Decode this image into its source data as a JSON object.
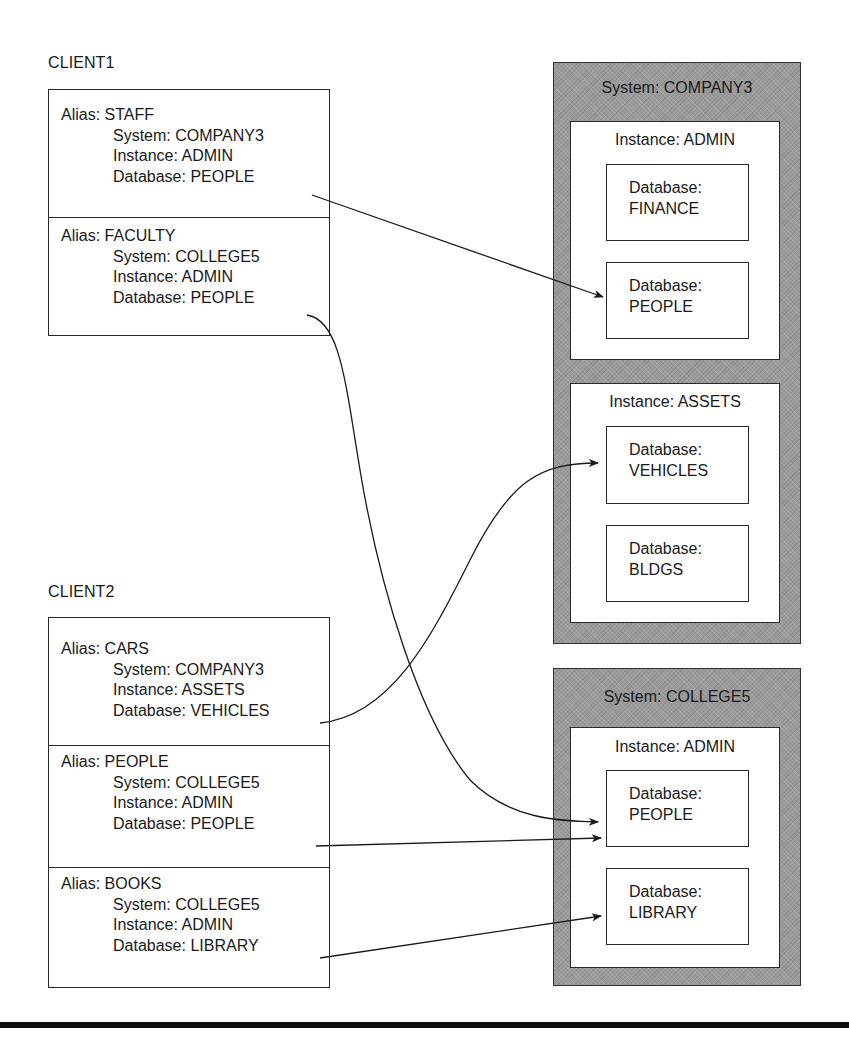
{
  "clients": [
    {
      "label": "CLIENT1",
      "aliases": [
        {
          "alias": "Alias: STAFF",
          "system": "System: COMPANY3",
          "instance": "Instance: ADMIN",
          "database": "Database: PEOPLE"
        },
        {
          "alias": "Alias: FACULTY",
          "system": "System: COLLEGE5",
          "instance": "Instance: ADMIN",
          "database": "Database: PEOPLE"
        }
      ]
    },
    {
      "label": "CLIENT2",
      "aliases": [
        {
          "alias": "Alias: CARS",
          "system": "System: COMPANY3",
          "instance": "Instance: ASSETS",
          "database": "Database: VEHICLES"
        },
        {
          "alias": "Alias: PEOPLE",
          "system": "System: COLLEGE5",
          "instance": "Instance: ADMIN",
          "database": "Database: PEOPLE"
        },
        {
          "alias": "Alias: BOOKS",
          "system": "System: COLLEGE5",
          "instance": "Instance: ADMIN",
          "database": "Database: LIBRARY"
        }
      ]
    }
  ],
  "systems": [
    {
      "title": "System: COMPANY3",
      "instances": [
        {
          "title": "Instance: ADMIN",
          "databases": [
            {
              "label": "Database:",
              "name": "FINANCE"
            },
            {
              "label": "Database:",
              "name": "PEOPLE"
            }
          ]
        },
        {
          "title": "Instance: ASSETS",
          "databases": [
            {
              "label": "Database:",
              "name": "VEHICLES"
            },
            {
              "label": "Database:",
              "name": "BLDGS"
            }
          ]
        }
      ]
    },
    {
      "title": "System: COLLEGE5",
      "instances": [
        {
          "title": "Instance: ADMIN",
          "databases": [
            {
              "label": "Database:",
              "name": "PEOPLE"
            },
            {
              "label": "Database:",
              "name": "LIBRARY"
            }
          ]
        }
      ]
    }
  ],
  "connections": [
    {
      "from": "CLIENT1/STAFF",
      "to": "COMPANY3/ADMIN/PEOPLE"
    },
    {
      "from": "CLIENT1/FACULTY",
      "to": "COLLEGE5/ADMIN/PEOPLE"
    },
    {
      "from": "CLIENT2/CARS",
      "to": "COMPANY3/ASSETS/VEHICLES"
    },
    {
      "from": "CLIENT2/PEOPLE",
      "to": "COLLEGE5/ADMIN/PEOPLE"
    },
    {
      "from": "CLIENT2/BOOKS",
      "to": "COLLEGE5/ADMIN/LIBRARY"
    }
  ],
  "colors": {
    "system_fill": "#9a9a9a",
    "line": "#1a1a1a",
    "box_fill": "#ffffff"
  }
}
